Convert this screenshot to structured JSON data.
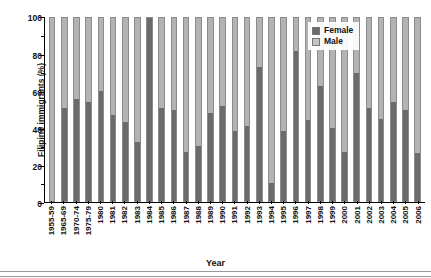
{
  "axes": {
    "ylabel": "Filipino immigrants (%)",
    "xlabel": "Year",
    "yticks": [
      "0",
      "20",
      "40",
      "60",
      "80",
      "100"
    ]
  },
  "legend": {
    "position": "top-right",
    "items": [
      {
        "label": "Female",
        "color": "#6b6b6b"
      },
      {
        "label": "Male",
        "color": "#c2c2c2"
      }
    ]
  },
  "colors": {
    "female": "#6b6b6b",
    "male": "#b3b3b3",
    "axis": "#000000",
    "background": "#ffffff"
  },
  "chart_data": {
    "type": "bar",
    "subtype": "stacked-100-percent",
    "title": "",
    "xlabel": "Year",
    "ylabel": "Filipino immigrants (%)",
    "ylim": [
      0,
      100
    ],
    "ytick_step": 20,
    "grid": false,
    "legend_position": "top-right",
    "categories": [
      "1955-59",
      "1965-69",
      "1970-74",
      "1975-79",
      "1980",
      "1981",
      "1982",
      "1983",
      "1984",
      "1985",
      "1986",
      "1987",
      "1988",
      "1989",
      "1990",
      "1991",
      "1992",
      "1993",
      "1994",
      "1995",
      "1996",
      "1997",
      "1998",
      "1999",
      "2000",
      "2001",
      "2002",
      "2003",
      "2004",
      "2005",
      "2006"
    ],
    "series": [
      {
        "name": "Female",
        "color": "#6b6b6b",
        "values": [
          0,
          51,
          56,
          54,
          60,
          47,
          43,
          32,
          100,
          51,
          50,
          27,
          30,
          48,
          52,
          38,
          41,
          73,
          10,
          38,
          82,
          44,
          63,
          40,
          27,
          70,
          51,
          45,
          54,
          50,
          26
        ]
      },
      {
        "name": "Male",
        "color": "#b3b3b3",
        "values": [
          100,
          49,
          44,
          46,
          40,
          53,
          57,
          68,
          0,
          49,
          50,
          73,
          70,
          52,
          48,
          62,
          59,
          27,
          90,
          62,
          18,
          56,
          37,
          60,
          73,
          30,
          49,
          55,
          46,
          50,
          74
        ]
      }
    ]
  }
}
